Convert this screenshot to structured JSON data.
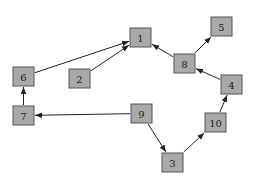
{
  "diagram": {
    "type": "directed-graph",
    "nodes": [
      {
        "id": "1",
        "label": "1"
      },
      {
        "id": "2",
        "label": "2"
      },
      {
        "id": "3",
        "label": "3"
      },
      {
        "id": "4",
        "label": "4"
      },
      {
        "id": "5",
        "label": "5"
      },
      {
        "id": "6",
        "label": "6"
      },
      {
        "id": "7",
        "label": "7"
      },
      {
        "id": "8",
        "label": "8"
      },
      {
        "id": "9",
        "label": "9"
      },
      {
        "id": "10",
        "label": "10"
      }
    ],
    "edges": [
      {
        "from": "6",
        "to": "1"
      },
      {
        "from": "2",
        "to": "1"
      },
      {
        "from": "8",
        "to": "1"
      },
      {
        "from": "8",
        "to": "5"
      },
      {
        "from": "4",
        "to": "8"
      },
      {
        "from": "10",
        "to": "4"
      },
      {
        "from": "3",
        "to": "10"
      },
      {
        "from": "9",
        "to": "3"
      },
      {
        "from": "9",
        "to": "7"
      },
      {
        "from": "7",
        "to": "6"
      }
    ],
    "colors": {
      "node_fill": "#a9a9a9",
      "node_border": "#555555",
      "edge": "#222222"
    }
  }
}
